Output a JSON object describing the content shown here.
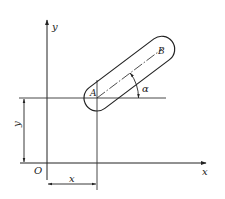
{
  "diagram": {
    "type": "coordinate-geometry",
    "labels": {
      "y_axis": "y",
      "x_axis": "x",
      "origin": "O",
      "point_a": "A",
      "point_b": "B",
      "angle": "α",
      "dim_x": "x",
      "dim_y": "y"
    },
    "colors": {
      "line": "#222222",
      "background": "#ffffff"
    }
  }
}
